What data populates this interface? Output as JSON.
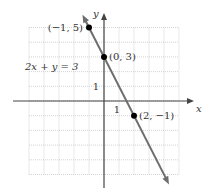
{
  "chart_data": {
    "type": "line",
    "title": "",
    "xlabel": "x",
    "ylabel": "y",
    "xlim": [
      -5,
      5
    ],
    "ylim": [
      -5,
      5
    ],
    "grid": true,
    "equation_label": "2x + y = 3",
    "tick_labels": {
      "x": "1",
      "y": "1"
    },
    "line": {
      "slope": -2,
      "intercept": 3,
      "x_range": [
        -1.3,
        4.2
      ],
      "color": "#6e6e6e"
    },
    "points": [
      {
        "x": -1,
        "y": 5,
        "label": "(−1, 5)"
      },
      {
        "x": 0,
        "y": 3,
        "label": "(0, 3)"
      },
      {
        "x": 2,
        "y": -1,
        "label": "(2, −1)"
      }
    ]
  }
}
